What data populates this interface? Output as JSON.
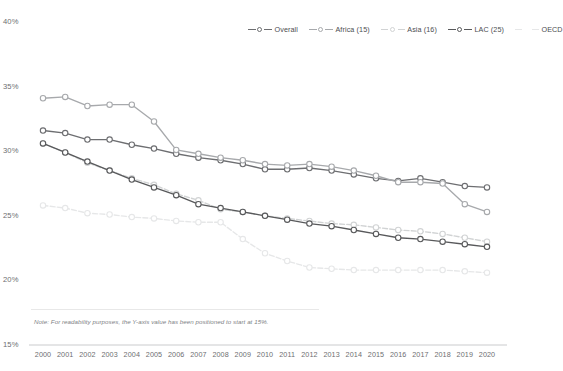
{
  "legend": {
    "position": "top-right",
    "items": [
      {
        "label": "Overall",
        "color": "#6d6e71",
        "marker": "circle",
        "dash": "solid"
      },
      {
        "label": "Africa (15)",
        "color": "#a7a9ac",
        "marker": "circle",
        "dash": "solid"
      },
      {
        "label": "Asia (16)",
        "color": "#d1d3d4",
        "marker": "circle",
        "dash": "dashed"
      },
      {
        "label": "LAC (25)",
        "color": "#58595b",
        "marker": "circle",
        "dash": "solid"
      },
      {
        "label": "OECD",
        "color": "#e6e7e8",
        "marker": "none",
        "dash": "dashed"
      }
    ]
  },
  "note": {
    "text": "Note: For readability purposes, the Y-axis value has been positioned to start at 15%."
  },
  "axes": {
    "y_ticks": [
      "40%",
      "35%",
      "30%",
      "25%",
      "20%",
      "15%"
    ],
    "x_ticks": [
      "2000",
      "2001",
      "2002",
      "2003",
      "2004",
      "2005",
      "2006",
      "2007",
      "2008",
      "2009",
      "2010",
      "2011",
      "2012",
      "2013",
      "2014",
      "2015",
      "2016",
      "2017",
      "2018",
      "2019",
      "2020"
    ]
  },
  "chart_data": {
    "type": "line",
    "title": "",
    "xlabel": "",
    "ylabel": "",
    "ylim": [
      15,
      40
    ],
    "grid": false,
    "legend_position": "top-right",
    "x": [
      2000,
      2001,
      2002,
      2003,
      2004,
      2005,
      2006,
      2007,
      2008,
      2009,
      2010,
      2011,
      2012,
      2013,
      2014,
      2015,
      2016,
      2017,
      2018,
      2019,
      2020
    ],
    "series": [
      {
        "name": "Overall",
        "color": "#6d6e71",
        "marker": "circle",
        "dash": "solid",
        "values": [
          31.6,
          31.4,
          30.9,
          30.9,
          30.5,
          30.2,
          29.8,
          29.5,
          29.3,
          29.0,
          28.6,
          28.6,
          28.7,
          28.5,
          28.2,
          27.9,
          27.7,
          27.9,
          27.6,
          27.3,
          27.2
        ]
      },
      {
        "name": "Africa (15)",
        "color": "#a7a9ac",
        "marker": "circle",
        "dash": "solid",
        "values": [
          34.1,
          34.2,
          33.5,
          33.6,
          33.6,
          32.3,
          30.1,
          29.8,
          29.5,
          29.3,
          29.0,
          28.9,
          29.0,
          28.8,
          28.5,
          28.1,
          27.6,
          27.6,
          27.5,
          25.9,
          25.3
        ]
      },
      {
        "name": "Asia (16)",
        "color": "#d1d3d4",
        "marker": "circle",
        "dash": "dashed",
        "values": [
          30.6,
          29.9,
          29.1,
          28.5,
          27.9,
          27.4,
          26.7,
          26.2,
          25.5,
          25.3,
          25.0,
          24.8,
          24.6,
          24.4,
          24.3,
          24.1,
          23.9,
          23.8,
          23.6,
          23.3,
          23.0
        ]
      },
      {
        "name": "LAC (25)",
        "color": "#58595b",
        "marker": "circle",
        "dash": "solid",
        "values": [
          30.6,
          29.9,
          29.2,
          28.5,
          27.8,
          27.2,
          26.6,
          25.9,
          25.6,
          25.3,
          25.0,
          24.7,
          24.4,
          24.2,
          23.9,
          23.6,
          23.3,
          23.2,
          23.0,
          22.8,
          22.6
        ]
      },
      {
        "name": "OECD",
        "color": "#e6e7e8",
        "marker": "circle",
        "dash": "dashed",
        "values": [
          25.8,
          25.6,
          25.2,
          25.1,
          24.9,
          24.8,
          24.6,
          24.5,
          24.5,
          23.2,
          22.1,
          21.5,
          21.0,
          20.9,
          20.8,
          20.8,
          20.8,
          20.8,
          20.8,
          20.7,
          20.6
        ]
      }
    ]
  }
}
